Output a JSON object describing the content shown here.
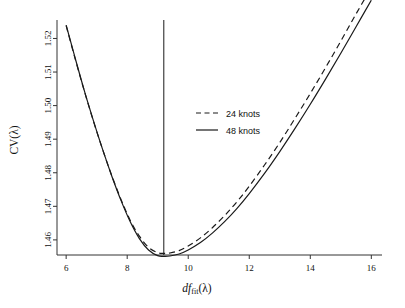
{
  "chart_data": {
    "type": "line",
    "title": "",
    "xlabel": "df_fit(lambda)",
    "xlabel_parts": {
      "df": "df",
      "sub": "fit",
      "arg": "(λ)"
    },
    "ylabel": "CV(λ)",
    "xlim": [
      5.7,
      16.35
    ],
    "ylim": [
      1.4555,
      1.5255
    ],
    "xticks": [
      6,
      8,
      10,
      12,
      14,
      16
    ],
    "xticklabels": [
      "6",
      "8",
      "10",
      "12",
      "14",
      "16"
    ],
    "yticks": [
      1.46,
      1.47,
      1.48,
      1.49,
      1.5,
      1.51,
      1.52
    ],
    "yticklabels": [
      "1.46",
      "1.47",
      "1.48",
      "1.49",
      "1.50",
      "1.51",
      "1.52"
    ],
    "grid": false,
    "legend_position": "center-right",
    "annotations": [
      {
        "name": "vertical-reference-line",
        "type": "vline",
        "x": 9.2,
        "style": "solid"
      }
    ],
    "series": [
      {
        "name": "24 knots",
        "style": "dashed",
        "color": "#1a1a1a",
        "x": [
          6.0,
          6.3,
          6.6,
          6.9,
          7.2,
          7.5,
          7.8,
          8.1,
          8.4,
          8.7,
          9.0,
          9.2,
          9.4,
          9.7,
          10.0,
          10.4,
          10.8,
          11.2,
          11.6,
          12.0,
          12.5,
          13.0,
          13.5,
          14.0,
          14.5,
          15.0,
          15.5,
          16.0
        ],
        "y": [
          1.5238,
          1.5138,
          1.5042,
          1.4952,
          1.4868,
          1.479,
          1.472,
          1.4658,
          1.4611,
          1.4578,
          1.4562,
          1.456,
          1.4561,
          1.4568,
          1.4582,
          1.4606,
          1.4637,
          1.4673,
          1.4714,
          1.476,
          1.4823,
          1.489,
          1.4962,
          1.5036,
          1.5113,
          1.5192,
          1.5273,
          1.5352
        ]
      },
      {
        "name": "48 knots",
        "style": "solid",
        "color": "#1a1a1a",
        "x": [
          6.0,
          6.3,
          6.6,
          6.9,
          7.2,
          7.5,
          7.8,
          8.1,
          8.4,
          8.7,
          9.0,
          9.2,
          9.4,
          9.7,
          10.0,
          10.4,
          10.8,
          11.2,
          11.6,
          12.0,
          12.5,
          13.0,
          13.5,
          14.0,
          14.5,
          15.0,
          15.5,
          16.0
        ],
        "y": [
          1.524,
          1.514,
          1.5043,
          1.4953,
          1.4868,
          1.4789,
          1.4717,
          1.4654,
          1.4604,
          1.457,
          1.4553,
          1.4551,
          1.4552,
          1.4558,
          1.457,
          1.4592,
          1.4621,
          1.4655,
          1.4694,
          1.4738,
          1.4798,
          1.4863,
          1.4932,
          1.5004,
          1.5079,
          1.5156,
          1.5235,
          1.5314
        ]
      }
    ]
  },
  "legend": {
    "entries": [
      {
        "label": "24 knots",
        "style": "dashed"
      },
      {
        "label": "48 knots",
        "style": "solid"
      }
    ]
  }
}
